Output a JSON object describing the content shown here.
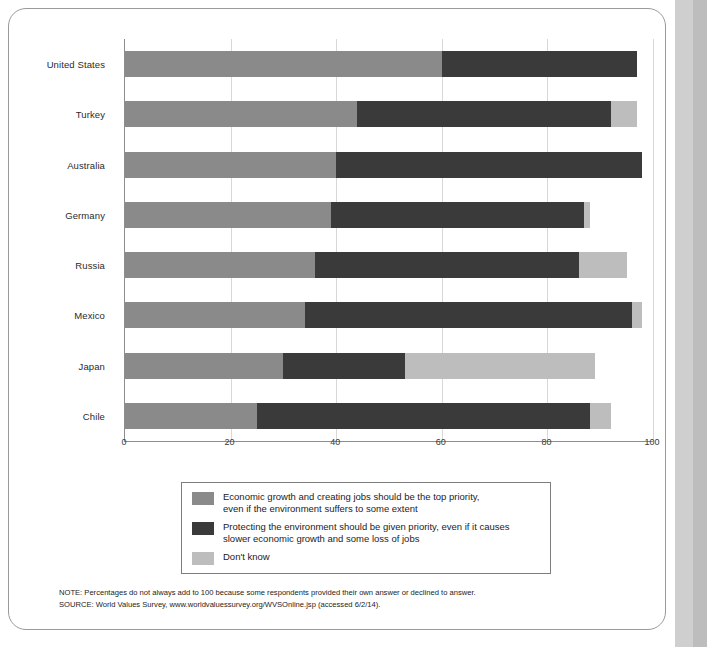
{
  "chart_data": {
    "type": "bar",
    "orientation": "horizontal",
    "stacked": true,
    "title": "",
    "xlabel": "",
    "ylabel": "",
    "xlim": [
      0,
      100
    ],
    "xticks": [
      0,
      20,
      40,
      60,
      80,
      100
    ],
    "grid": true,
    "legend_position": "bottom",
    "categories": [
      "United States",
      "Turkey",
      "Australia",
      "Germany",
      "Russia",
      "Mexico",
      "Japan",
      "Chile"
    ],
    "series": [
      {
        "name": "Economic growth and creating jobs should be the top priority, even if the environment suffers to some extent",
        "short_name": "Economic growth",
        "color": "#8a8a8a",
        "values": [
          60,
          44,
          40,
          39,
          36,
          34,
          30,
          25
        ]
      },
      {
        "name": "Protecting the environment should be given priority, even if it causes slower economic growth and some loss of jobs",
        "short_name": "Protecting the environment",
        "color": "#3a3a3a",
        "values": [
          37,
          48,
          58,
          48,
          50,
          62,
          23,
          63
        ]
      },
      {
        "name": "Don't know",
        "short_name": "Don't know",
        "color": "#bdbdbd",
        "values": [
          0,
          5,
          0,
          1,
          9,
          2,
          36,
          4
        ]
      }
    ]
  },
  "legend": {
    "items": [
      {
        "swatch_class": "growth",
        "line1": "Economic growth and creating jobs should be the top priority,",
        "line2": "even if the environment suffers to some extent"
      },
      {
        "swatch_class": "environment",
        "line1": "Protecting the environment should be given priority, even if it causes",
        "line2": "slower economic growth and some loss of jobs"
      },
      {
        "swatch_class": "dontknow",
        "line1": "Don't know",
        "line2": ""
      }
    ]
  },
  "notes": {
    "note": "NOTE: Percentages do not always add to 100 because some respondents provided their own answer or declined to answer.",
    "source": "SOURCE: World Values Survey, www.worldvaluessurvey.org/WVSOnline.jsp (accessed 6/2/14)."
  }
}
